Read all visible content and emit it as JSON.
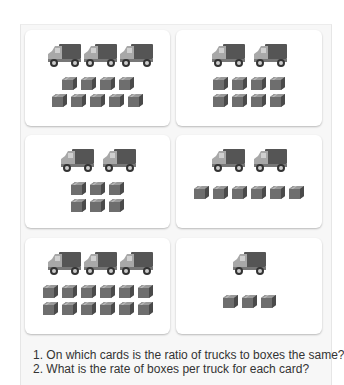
{
  "worksheet": {
    "cards": [
      {
        "id": 1,
        "trucks": 3,
        "boxes": 9,
        "box_rows": [
          4,
          5
        ]
      },
      {
        "id": 2,
        "trucks": 2,
        "boxes": 8,
        "box_rows": [
          4,
          4
        ]
      },
      {
        "id": 3,
        "trucks": 2,
        "boxes": 6,
        "box_rows": [
          3,
          3
        ]
      },
      {
        "id": 4,
        "trucks": 2,
        "boxes": 6,
        "box_rows": [
          6
        ]
      },
      {
        "id": 5,
        "trucks": 3,
        "boxes": 12,
        "box_rows": [
          6,
          6
        ]
      },
      {
        "id": 6,
        "trucks": 1,
        "boxes": 3,
        "box_rows": [
          3
        ]
      }
    ],
    "questions": [
      "1. On which cards is the ratio of trucks to boxes the same?",
      "2. What is the rate of boxes per truck for each card?"
    ],
    "icons": {
      "truck": "truck-icon",
      "box": "box-icon"
    },
    "colors": {
      "truck_cab": "#a8a8a8",
      "truck_cargo": "#555555",
      "box": "#6e6e6e",
      "card_bg": "#ffffff",
      "panel_bg": "#f7f7f7"
    }
  }
}
